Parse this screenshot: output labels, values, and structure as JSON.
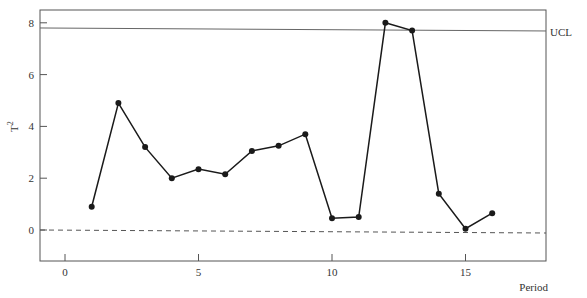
{
  "chart_data": {
    "type": "line",
    "title": "",
    "xlabel": "Period",
    "ylabel": "T²",
    "x": [
      1,
      2,
      3,
      4,
      5,
      6,
      7,
      8,
      9,
      10,
      11,
      12,
      13,
      14,
      15,
      16
    ],
    "series": [
      {
        "name": "T²",
        "values": [
          0.9,
          4.9,
          3.2,
          2.0,
          2.35,
          2.15,
          3.05,
          3.25,
          3.7,
          0.45,
          0.5,
          8.0,
          7.7,
          1.4,
          0.05,
          0.65
        ]
      }
    ],
    "reference_lines": [
      {
        "name": "UCL",
        "value": 7.8,
        "style": "solid"
      },
      {
        "name": "zero",
        "value": 0,
        "style": "dashed"
      }
    ],
    "xticks": [
      0,
      5,
      10,
      15
    ],
    "xtick_labels": [
      "0",
      "5",
      "10",
      "15"
    ],
    "yticks": [
      0,
      2,
      4,
      6,
      8
    ],
    "ytick_labels": [
      "0",
      "2",
      "4",
      "6",
      "8"
    ],
    "xlim": [
      -1,
      18
    ],
    "ylim": [
      -1.2,
      8.5
    ],
    "grid": false,
    "legend": null
  },
  "labels": {
    "ucl": "UCL",
    "x_title": "Period",
    "y_title_base": "T",
    "y_title_sup": "2"
  },
  "colors": {
    "line": "#1a1a1a",
    "frame": "#555555",
    "ucl": "#666666"
  }
}
